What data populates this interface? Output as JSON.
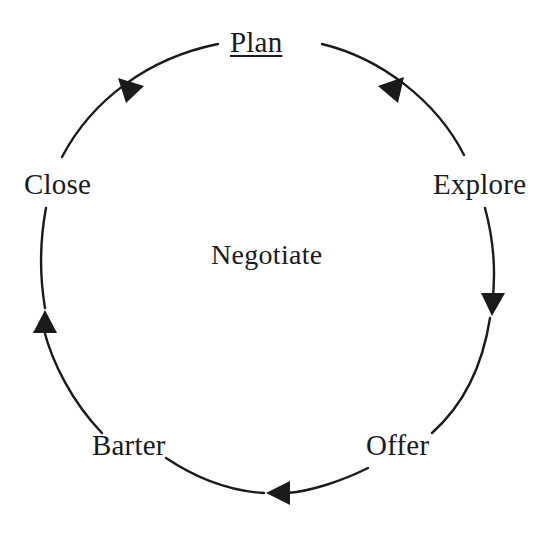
{
  "diagram": {
    "title": "Negotiate",
    "type": "cycle",
    "direction": "clockwise",
    "center_label": "Negotiate",
    "line_color": "#1a1a1a",
    "text_color": "#1a1a1a",
    "background_color": "#ffffff",
    "stages": [
      {
        "label": "Plan",
        "position": "top",
        "underlined": true
      },
      {
        "label": "Explore",
        "position": "right",
        "underlined": false
      },
      {
        "label": "Offer",
        "position": "bottom-right",
        "underlined": false
      },
      {
        "label": "Barter",
        "position": "bottom-left",
        "underlined": false
      },
      {
        "label": "Close",
        "position": "left",
        "underlined": false
      }
    ],
    "arrows": [
      {
        "from": "Plan",
        "to": "Explore"
      },
      {
        "from": "Explore",
        "to": "Offer"
      },
      {
        "from": "Offer",
        "to": "Barter"
      },
      {
        "from": "Barter",
        "to": "Close"
      },
      {
        "from": "Close",
        "to": "Plan"
      }
    ]
  }
}
